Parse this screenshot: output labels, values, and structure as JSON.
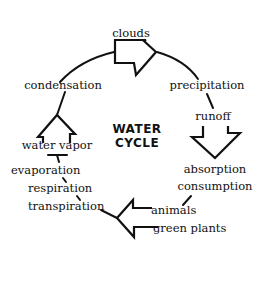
{
  "diagram": {
    "title_line1": "WATER",
    "title_line2": "CYCLE",
    "nodes": {
      "clouds": "clouds",
      "precipitation": "precipitation",
      "runoff": "runoff",
      "absorption": "absorption",
      "consumption": "consumption",
      "animals": "animals",
      "green_plants": "green plants",
      "transpiration": "transpiration",
      "respiration": "respiration",
      "evaporation": "evaporation",
      "water_vapor": "water vapor",
      "condensation": "condensation"
    },
    "flow": [
      "clouds",
      "precipitation",
      "runoff",
      "absorption / consumption",
      "animals / green plants",
      "transpiration / respiration / evaporation",
      "water vapor",
      "condensation",
      "clouds"
    ],
    "colors": {
      "ink": "#111111",
      "background": "#ffffff"
    }
  }
}
